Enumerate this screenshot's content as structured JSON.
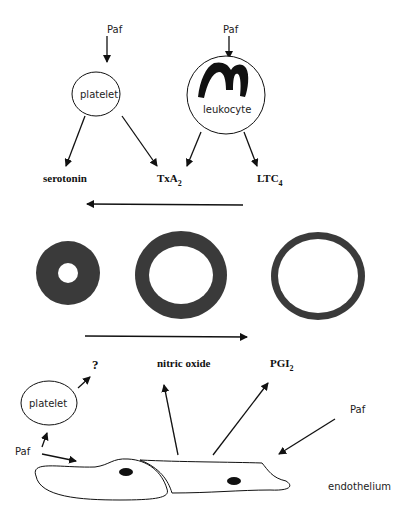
{
  "diagram": {
    "top": {
      "paf_left": "Paf",
      "paf_right": "Paf",
      "platelet_label": "platelet",
      "leukocyte_label": "leukocyte",
      "products": {
        "serotonin": "serotonin",
        "txa_main": "TxA",
        "txa_sub": "2",
        "ltc_main": "LTC",
        "ltc_sub": "4"
      }
    },
    "vessels": {
      "states": [
        "constricted",
        "normal",
        "dilated"
      ],
      "color": "#3a3a3a"
    },
    "bottom": {
      "question": "?",
      "platelet_label": "platelet",
      "paf_left": "Paf",
      "paf_right": "Paf",
      "nitric_oxide": "nitric  oxide",
      "pgi_main": "PGI",
      "pgi_sub": "2",
      "endothelium_label": "endothelium"
    }
  }
}
